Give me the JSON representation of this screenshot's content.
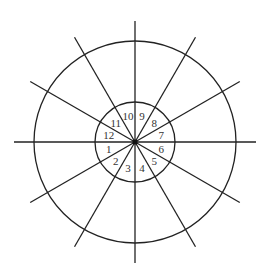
{
  "diagram": {
    "type": "circular-division",
    "center": [
      135,
      142
    ],
    "outer_radius": 101,
    "inner_radius": 40,
    "spoke_length": 121,
    "spoke_count": 12,
    "line_color": "#222222",
    "segments": [
      {
        "label": "1",
        "angle_deg": 195
      },
      {
        "label": "2",
        "angle_deg": 225
      },
      {
        "label": "3",
        "angle_deg": 255
      },
      {
        "label": "4",
        "angle_deg": 285
      },
      {
        "label": "5",
        "angle_deg": 315
      },
      {
        "label": "6",
        "angle_deg": 345
      },
      {
        "label": "7",
        "angle_deg": 15
      },
      {
        "label": "8",
        "angle_deg": 45
      },
      {
        "label": "9",
        "angle_deg": 75
      },
      {
        "label": "10",
        "angle_deg": 105
      },
      {
        "label": "11",
        "angle_deg": 135
      },
      {
        "label": "12",
        "angle_deg": 165
      }
    ]
  }
}
